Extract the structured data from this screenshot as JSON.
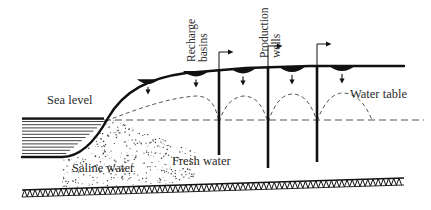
{
  "figure": {
    "type": "cross-section-diagram",
    "colors": {
      "ink": "#111111",
      "text": "#2b2b2b",
      "dash": "#555555",
      "stipple": "#444444",
      "background": "#ffffff"
    }
  },
  "labels": {
    "sea_level": "Sea level",
    "saline_water": "Saline water",
    "fresh_water": "Fresh water",
    "water_table": "Water table",
    "recharge_basins_l1": "Recharge",
    "recharge_basins_l2": "basins",
    "production_wells_l1": "Production",
    "production_wells_l2": "wells"
  },
  "geometry": {
    "ground_surface": "M 22,157 L 62,157 C 80,157 96,140 108,118 C 124,90 150,78 186,73 L 246,68 L 310,66 L 372,66 L 404,66",
    "sea_level_line_y": 119,
    "sea_hatch": {
      "x": 22,
      "y": 119,
      "width": 86,
      "height": 38,
      "line_spacing": 3.2
    },
    "dashed_sea_level": {
      "x1": 104,
      "x2": 424,
      "y": 120
    },
    "bedrock_top": "M 22,190 L 404,178",
    "bedrock_zigzag_height": 7
  },
  "recharge_basins": [
    {
      "id": "basin-1",
      "cx": 196,
      "cy": 72,
      "rx": 13,
      "ry": 4.5,
      "arrow_y": 86
    },
    {
      "id": "basin-2",
      "cx": 243,
      "cy": 69,
      "rx": 13,
      "ry": 4.5,
      "arrow_y": 84
    },
    {
      "id": "basin-3",
      "cx": 292,
      "cy": 67,
      "rx": 14,
      "ry": 5.0,
      "arrow_y": 83
    },
    {
      "id": "basin-4",
      "cx": 342,
      "cy": 66,
      "rx": 14,
      "ry": 5.0,
      "arrow_y": 82
    },
    {
      "id": "basin-5",
      "cx": 148,
      "cy": 80,
      "rx": 11,
      "ry": 4.0,
      "arrow_y": 93
    }
  ],
  "production_wells": [
    {
      "id": "well-1",
      "x": 219,
      "top": 70,
      "bottom": 155,
      "head_flag_y": 52
    },
    {
      "id": "well-2",
      "x": 268,
      "top": 67,
      "bottom": 168,
      "head_flag_y": 46
    },
    {
      "id": "well-3",
      "x": 317,
      "top": 66,
      "bottom": 162,
      "head_flag_y": 44
    }
  ],
  "water_table_mounds": [
    {
      "id": "mound-1",
      "path": "M 106,121 C 140,108 168,98 196,96 C 212,96 216,108 219,122"
    },
    {
      "id": "mound-2",
      "path": "M 219,122 C 224,108 230,98 243,96 C 258,96 263,108 268,122"
    },
    {
      "id": "mound-3",
      "path": "M 268,122 C 274,106 280,95 292,94 C 306,94 312,107 317,121"
    },
    {
      "id": "mound-4",
      "path": "M 317,121 C 323,106 330,94 342,93 C 358,93 366,106 372,120"
    }
  ],
  "saline_wedge": {
    "description": "stippled intrusion wedge tapering to the right beneath the fresh water lens",
    "outline": "M 62,157 C 80,157 96,140 108,118 L 196,152 L 196,182 L 62,188 Z",
    "dot_count": 620
  }
}
